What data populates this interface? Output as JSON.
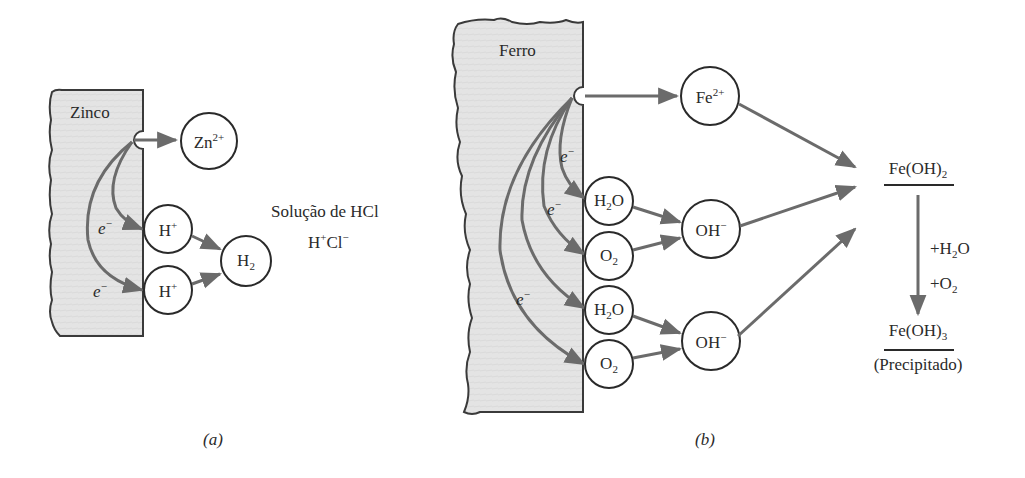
{
  "colors": {
    "metal_fill": "#e4e4e4",
    "metal_stroke": "#3a3a3a",
    "arrow": "#6b6b6b",
    "text": "#2a2a2a",
    "background": "#ffffff"
  },
  "panel_a": {
    "caption": "(a)",
    "metal_label": "Zinco",
    "solution_label": "Solução de HCl",
    "solution_ions": {
      "h": "H",
      "h_sup": "+",
      "cl": "Cl",
      "cl_sup": "−"
    },
    "species": {
      "zn_ion": {
        "base": "Zn",
        "sup": "2+"
      },
      "h_ion_1": {
        "base": "H",
        "sup": "+"
      },
      "h_ion_2": {
        "base": "H",
        "sup": "+"
      },
      "h2": {
        "base": "H",
        "sub": "2"
      }
    },
    "electron_labels": [
      {
        "base": "e",
        "sup": "−"
      },
      {
        "base": "e",
        "sup": "−"
      }
    ]
  },
  "panel_b": {
    "caption": "(b)",
    "metal_label": "Ferro",
    "species": {
      "fe_ion": {
        "base": "Fe",
        "sup": "2+"
      },
      "h2o_1": {
        "pre": "H",
        "sub": "2",
        "post": "O"
      },
      "o2_1": {
        "base": "O",
        "sub": "2"
      },
      "h2o_2": {
        "pre": "H",
        "sub": "2",
        "post": "O"
      },
      "o2_2": {
        "base": "O",
        "sub": "2"
      },
      "oh_1": {
        "base": "OH",
        "sup": "−"
      },
      "oh_2": {
        "base": "OH",
        "sup": "−"
      }
    },
    "electron_labels": [
      {
        "base": "e",
        "sup": "−"
      },
      {
        "base": "e",
        "sup": "−"
      },
      {
        "base": "e",
        "sup": "−"
      }
    ],
    "product_1": {
      "base": "Fe(OH)",
      "sub": "2"
    },
    "reagents": {
      "line1": {
        "pre": "+H",
        "sub": "2",
        "post": "O"
      },
      "line2": {
        "pre": "+O",
        "sub": "2"
      }
    },
    "product_2": {
      "base": "Fe(OH)",
      "sub": "3"
    },
    "product_2_note": "(Precipitado)"
  }
}
